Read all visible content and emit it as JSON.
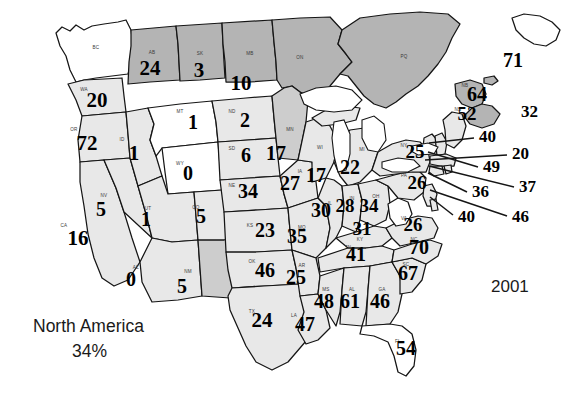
{
  "caption": {
    "region_label": "North America",
    "percent_label": "34%",
    "year_label": "2001"
  },
  "chart_data": {
    "type": "map",
    "title": "North America",
    "subtitle": "34%",
    "year": "2001",
    "value_type": "count per region",
    "legend_position": "none",
    "shading": {
      "light_gray": "#e8e8e8",
      "medium_gray": "#cdcdcd",
      "dark_gray": "#b4b4b4",
      "white": "#ffffff",
      "outline": "#151515"
    },
    "regions": [
      {
        "abbr": "BC",
        "value": null,
        "shade": "white"
      },
      {
        "abbr": "AB",
        "value": 24,
        "shade": "dark_gray"
      },
      {
        "abbr": "SK",
        "value": 3,
        "shade": "dark_gray"
      },
      {
        "abbr": "MB",
        "value": 10,
        "shade": "dark_gray"
      },
      {
        "abbr": "ON",
        "value": null,
        "shade": "dark_gray"
      },
      {
        "abbr": "PQ",
        "value": null,
        "shade": "dark_gray"
      },
      {
        "abbr": "NB",
        "value": 64,
        "shade": "dark_gray"
      },
      {
        "abbr": "NS",
        "value": 52,
        "shade": "dark_gray"
      },
      {
        "abbr": "PE",
        "value": null,
        "shade": "dark_gray"
      },
      {
        "abbr": "WA",
        "value": 20,
        "shade": "light_gray"
      },
      {
        "abbr": "OR",
        "value": 72,
        "shade": "light_gray"
      },
      {
        "abbr": "ID",
        "value": 1,
        "shade": "light_gray"
      },
      {
        "abbr": "MT",
        "value": 1,
        "shade": "white"
      },
      {
        "abbr": "WY",
        "value": 0,
        "shade": "white"
      },
      {
        "abbr": "ND",
        "value": 2,
        "shade": "light_gray"
      },
      {
        "abbr": "SD",
        "value": 6,
        "shade": "light_gray"
      },
      {
        "abbr": "NE",
        "value": 34,
        "shade": "light_gray"
      },
      {
        "abbr": "MN",
        "value": 17,
        "shade": "medium_gray"
      },
      {
        "abbr": "WI",
        "value": 17,
        "shade": "light_gray"
      },
      {
        "abbr": "MI",
        "value": 22,
        "shade": "light_gray"
      },
      {
        "abbr": "IA",
        "value": 27,
        "shade": "light_gray"
      },
      {
        "abbr": "IL",
        "value": 30,
        "shade": "light_gray"
      },
      {
        "abbr": "IN",
        "value": 28,
        "shade": "light_gray"
      },
      {
        "abbr": "OH",
        "value": 34,
        "shade": "light_gray"
      },
      {
        "abbr": "MO",
        "value": 35,
        "shade": "light_gray"
      },
      {
        "abbr": "KS",
        "value": 23,
        "shade": "light_gray"
      },
      {
        "abbr": "KY",
        "value": 31,
        "shade": "light_gray"
      },
      {
        "abbr": "CA",
        "value": 16,
        "shade": "light_gray"
      },
      {
        "abbr": "NV",
        "value": 5,
        "shade": "light_gray"
      },
      {
        "abbr": "UT",
        "value": 1,
        "shade": "light_gray"
      },
      {
        "abbr": "CO",
        "value": 5,
        "shade": "light_gray"
      },
      {
        "abbr": "AZ",
        "value": 0,
        "shade": "light_gray"
      },
      {
        "abbr": "NM",
        "value": 5,
        "shade": "medium_gray"
      },
      {
        "abbr": "OK",
        "value": 46,
        "shade": "light_gray"
      },
      {
        "abbr": "TX",
        "value": 24,
        "shade": "light_gray"
      },
      {
        "abbr": "AR",
        "value": 25,
        "shade": "light_gray"
      },
      {
        "abbr": "LA",
        "value": 47,
        "shade": "light_gray"
      },
      {
        "abbr": "MS",
        "value": 48,
        "shade": "light_gray"
      },
      {
        "abbr": "AL",
        "value": 61,
        "shade": "light_gray"
      },
      {
        "abbr": "GA",
        "value": 46,
        "shade": "light_gray"
      },
      {
        "abbr": "FL",
        "value": 54,
        "shade": "white"
      },
      {
        "abbr": "TN",
        "value": 41,
        "shade": "light_gray"
      },
      {
        "abbr": "SC",
        "value": 67,
        "shade": "light_gray"
      },
      {
        "abbr": "NC",
        "value": 70,
        "shade": "light_gray"
      },
      {
        "abbr": "VA",
        "value": 26,
        "shade": "light_gray"
      },
      {
        "abbr": "WV",
        "value": null,
        "shade": "white"
      },
      {
        "abbr": "PA",
        "value": 26,
        "shade": "light_gray"
      },
      {
        "abbr": "NY",
        "value": 25,
        "shade": "light_gray"
      },
      {
        "abbr": "VT",
        "value": 40,
        "shade": "light_gray"
      },
      {
        "abbr": "NH",
        "value": 49,
        "shade": "light_gray"
      },
      {
        "abbr": "ME",
        "value": 32,
        "shade": "light_gray"
      },
      {
        "abbr": "MA",
        "value": 20,
        "shade": "light_gray"
      },
      {
        "abbr": "CT",
        "value": 37,
        "shade": "light_gray"
      },
      {
        "abbr": "RI",
        "value": 36,
        "shade": "light_gray"
      },
      {
        "abbr": "NJ",
        "value": 40,
        "shade": "light_gray"
      },
      {
        "abbr": "DE",
        "value": 46,
        "shade": "light_gray"
      },
      {
        "abbr": "NF",
        "value": 71,
        "shade": "white"
      }
    ],
    "inline_values": [
      {
        "abbr": "AB",
        "value": "24",
        "x": 150,
        "y": 70,
        "size": 21
      },
      {
        "abbr": "SK",
        "value": "3",
        "x": 199,
        "y": 72,
        "size": 21
      },
      {
        "abbr": "MB",
        "value": "10",
        "x": 241,
        "y": 85,
        "size": 21
      },
      {
        "abbr": "WA",
        "value": "20",
        "x": 97,
        "y": 102,
        "size": 21
      },
      {
        "abbr": "OR",
        "value": "72",
        "x": 87,
        "y": 145,
        "size": 21
      },
      {
        "abbr": "ID",
        "value": "1",
        "x": 134,
        "y": 155,
        "size": 21
      },
      {
        "abbr": "MT",
        "value": "1",
        "x": 193,
        "y": 124,
        "size": 20
      },
      {
        "abbr": "ND",
        "value": "2",
        "x": 245,
        "y": 122,
        "size": 20
      },
      {
        "abbr": "SD",
        "value": "6",
        "x": 246,
        "y": 157,
        "size": 20
      },
      {
        "abbr": "NE",
        "value": "34",
        "x": 248,
        "y": 193,
        "size": 20
      },
      {
        "abbr": "WY",
        "value": "0",
        "x": 188,
        "y": 175,
        "size": 20
      },
      {
        "abbr": "MN",
        "value": "17",
        "x": 276,
        "y": 155,
        "size": 20
      },
      {
        "abbr": "WI",
        "value": "17",
        "x": 316,
        "y": 177,
        "size": 20
      },
      {
        "abbr": "MI",
        "value": "22",
        "x": 350,
        "y": 169,
        "size": 20
      },
      {
        "abbr": "IA",
        "value": "27",
        "x": 290,
        "y": 185,
        "size": 20
      },
      {
        "abbr": "IL",
        "value": "30",
        "x": 321,
        "y": 212,
        "size": 20
      },
      {
        "abbr": "IN",
        "value": "28",
        "x": 345,
        "y": 208,
        "size": 19
      },
      {
        "abbr": "OH",
        "value": "34",
        "x": 369,
        "y": 208,
        "size": 19
      },
      {
        "abbr": "MO",
        "value": "35",
        "x": 297,
        "y": 238,
        "size": 20
      },
      {
        "abbr": "KS",
        "value": "23",
        "x": 265,
        "y": 232,
        "size": 20
      },
      {
        "abbr": "KY",
        "value": "31",
        "x": 362,
        "y": 231,
        "size": 19
      },
      {
        "abbr": "CA",
        "value": "16",
        "x": 78,
        "y": 240,
        "size": 21
      },
      {
        "abbr": "NV",
        "value": "5",
        "x": 101,
        "y": 211,
        "size": 20
      },
      {
        "abbr": "UT",
        "value": "1",
        "x": 146,
        "y": 221,
        "size": 20
      },
      {
        "abbr": "CO",
        "value": "5",
        "x": 201,
        "y": 218,
        "size": 20
      },
      {
        "abbr": "AZ",
        "value": "0",
        "x": 131,
        "y": 281,
        "size": 20
      },
      {
        "abbr": "NM",
        "value": "5",
        "x": 182,
        "y": 288,
        "size": 20
      },
      {
        "abbr": "OK",
        "value": "46",
        "x": 265,
        "y": 272,
        "size": 20
      },
      {
        "abbr": "TX",
        "value": "24",
        "x": 262,
        "y": 322,
        "size": 21
      },
      {
        "abbr": "AR",
        "value": "25",
        "x": 296,
        "y": 279,
        "size": 20
      },
      {
        "abbr": "LA",
        "value": "47",
        "x": 305,
        "y": 326,
        "size": 20
      },
      {
        "abbr": "MS",
        "value": "48",
        "x": 324,
        "y": 303,
        "size": 20
      },
      {
        "abbr": "AL",
        "value": "61",
        "x": 350,
        "y": 303,
        "size": 20
      },
      {
        "abbr": "GA",
        "value": "46",
        "x": 380,
        "y": 303,
        "size": 20
      },
      {
        "abbr": "FL",
        "value": "54",
        "x": 406,
        "y": 350,
        "size": 20
      },
      {
        "abbr": "TN",
        "value": "41",
        "x": 356,
        "y": 256,
        "size": 20
      },
      {
        "abbr": "SC",
        "value": "67",
        "x": 408,
        "y": 275,
        "size": 20
      },
      {
        "abbr": "NC",
        "value": "70",
        "x": 419,
        "y": 249,
        "size": 20
      },
      {
        "abbr": "VA",
        "value": "26",
        "x": 413,
        "y": 227,
        "size": 19
      },
      {
        "abbr": "PA",
        "value": "26",
        "x": 417,
        "y": 185,
        "size": 19
      },
      {
        "abbr": "NY",
        "value": "25",
        "x": 415,
        "y": 154,
        "size": 19
      },
      {
        "abbr": "NB",
        "value": "64",
        "x": 477,
        "y": 96,
        "size": 20
      },
      {
        "abbr": "NS",
        "value": "52",
        "x": 467,
        "y": 116,
        "size": 19
      },
      {
        "abbr": "NF",
        "value": "71",
        "x": 513,
        "y": 62,
        "size": 20
      }
    ],
    "callouts": [
      {
        "abbr": "ME",
        "value": "32",
        "x": 521,
        "y": 113,
        "lx1": 0,
        "ly1": 0,
        "lx2": 0,
        "ly2": 0
      },
      {
        "abbr": "VT",
        "value": "40",
        "x": 479,
        "y": 138,
        "lx1": 429,
        "ly1": 143,
        "lx2": 474,
        "ly2": 138
      },
      {
        "abbr": "MA",
        "value": "20",
        "x": 512,
        "y": 155,
        "lx1": 425,
        "ly1": 160,
        "lx2": 507,
        "ly2": 155
      },
      {
        "abbr": "NH",
        "value": "49",
        "x": 483,
        "y": 168,
        "lx1": 428,
        "ly1": 152,
        "lx2": 478,
        "ly2": 167
      },
      {
        "abbr": "CT",
        "value": "37",
        "x": 519,
        "y": 188,
        "lx1": 429,
        "ly1": 166,
        "lx2": 514,
        "ly2": 187
      },
      {
        "abbr": "RI",
        "value": "36",
        "x": 472,
        "y": 193,
        "lx1": 428,
        "ly1": 173,
        "lx2": 467,
        "ly2": 192
      },
      {
        "abbr": "NJ",
        "value": "40",
        "x": 458,
        "y": 218,
        "lx1": 430,
        "ly1": 197,
        "lx2": 453,
        "ly2": 215
      },
      {
        "abbr": "DE",
        "value": "46",
        "x": 512,
        "y": 218,
        "lx1": 430,
        "ly1": 190,
        "lx2": 507,
        "ly2": 216
      }
    ]
  }
}
